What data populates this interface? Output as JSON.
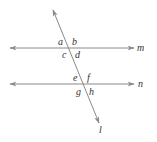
{
  "diagram": {
    "colors": {
      "line": "#8a8a8a",
      "text": "#333333",
      "background": "#ffffff"
    },
    "lines": [
      {
        "name": "m",
        "type": "horizontal",
        "y": 48,
        "x1": 10,
        "x2": 134
      },
      {
        "name": "n",
        "type": "horizontal",
        "y": 84,
        "x1": 10,
        "x2": 134
      },
      {
        "name": "l",
        "type": "transversal",
        "x1": 53,
        "y1": 10,
        "x2": 99,
        "y2": 123
      }
    ],
    "line_labels": {
      "m": "m",
      "n": "n",
      "l": "l"
    },
    "angle_labels": {
      "a": "a",
      "b": "b",
      "c": "c",
      "d": "d",
      "e": "e",
      "f": "f",
      "g": "g",
      "h": "h"
    }
  }
}
